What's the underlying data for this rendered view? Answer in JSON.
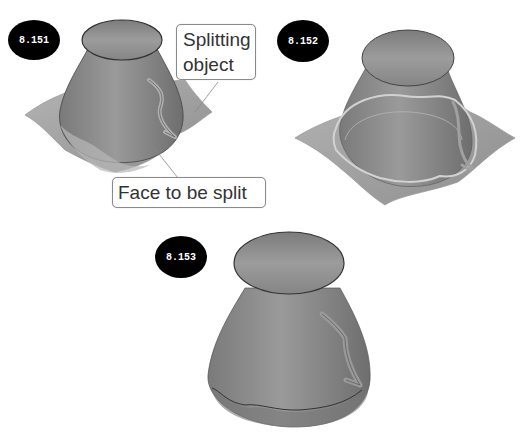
{
  "figures": [
    {
      "id": "8.151",
      "label": "8.151"
    },
    {
      "id": "8.152",
      "label": "8.152"
    },
    {
      "id": "8.153",
      "label": "8.153"
    }
  ],
  "callouts": {
    "splitting_object": "Splitting\nobject",
    "splitting_object_line1": "Splitting",
    "splitting_object_line2": "object",
    "face_to_be_split": "Face to be split"
  },
  "colors": {
    "badge": "#000000",
    "badge_text": "#ffffff",
    "body_gray": "#8a8a8a",
    "sheet_gray": "#a8a8a8",
    "highlight": "#c8c8c8",
    "callout_border": "#8a8a8a"
  }
}
